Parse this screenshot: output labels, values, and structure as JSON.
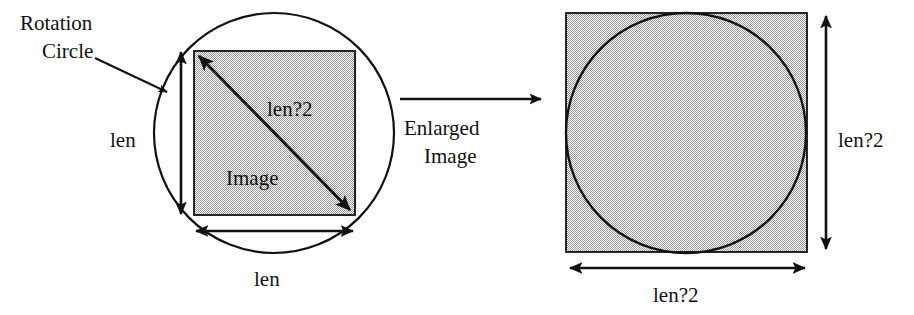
{
  "figure": {
    "background_color": "#ffffff",
    "stroke_color": "#111111",
    "fill_color": "#c8c8c8",
    "labels": {
      "rotation_circle_line1": "Rotation",
      "rotation_circle_line2": "Circle",
      "left_side_len": "len",
      "left_bottom_len": "len",
      "left_diagonal": "len?2",
      "image_text": "Image",
      "transform_line1": "Enlarged",
      "transform_line2": "Image",
      "right_vertical": "len?2",
      "right_bottom": "len?2"
    }
  }
}
